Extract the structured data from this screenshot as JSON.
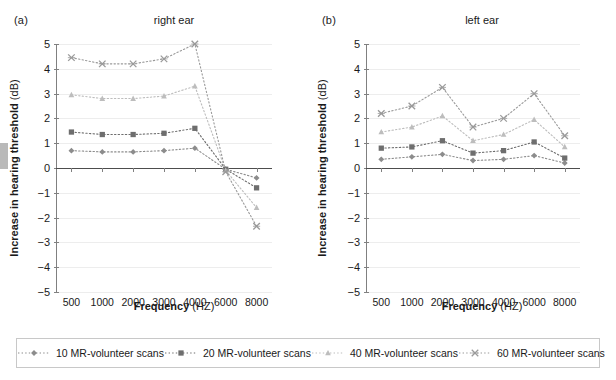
{
  "figure": {
    "width": 616,
    "height": 380,
    "panels": [
      {
        "tag": "(a)",
        "title": "right ear"
      },
      {
        "tag": "(b)",
        "title": "left ear"
      }
    ],
    "axis": {
      "xlabel_bold": "Frequency",
      "xlabel_rest": " (HZ)",
      "ylabel_bold": "Increase in hearing threshold",
      "ylabel_rest": " (dB)",
      "yticks": [
        "5",
        "4",
        "3",
        "2",
        "1",
        "0",
        "-1",
        "-2",
        "-3",
        "-4",
        "-5"
      ],
      "xticks": [
        "500",
        "1000",
        "2000",
        "3000",
        "4000",
        "6000",
        "8000"
      ]
    }
  },
  "legend": {
    "items": [
      {
        "label": "10 MR-volunteer scans",
        "marker": "diamond-marker",
        "color": "#8c8c8c"
      },
      {
        "label": "20 MR-volunteer scans",
        "marker": "square-marker",
        "color": "#6e6e6e"
      },
      {
        "label": "40 MR-volunteer scans",
        "marker": "triangle-marker",
        "color": "#bdbdbd"
      },
      {
        "label": "60 MR-volunteer scans",
        "marker": "x-marker",
        "color": "#9a9a9a"
      }
    ]
  },
  "chart_data": [
    {
      "type": "line",
      "title": "right ear",
      "panel": "(a)",
      "xlabel": "Frequency (HZ)",
      "ylabel": "Increase in hearing threshold (dB)",
      "categories": [
        500,
        1000,
        2000,
        3000,
        4000,
        6000,
        8000
      ],
      "ylim": [
        -5,
        5
      ],
      "grid": true,
      "legend_position": "bottom",
      "series": [
        {
          "name": "10 MR-volunteer scans",
          "marker": "diamond",
          "color": "#8c8c8c",
          "values": [
            0.7,
            0.65,
            0.65,
            0.7,
            0.8,
            -0.05,
            -0.4
          ]
        },
        {
          "name": "20 MR-volunteer scans",
          "marker": "square",
          "color": "#6e6e6e",
          "values": [
            1.45,
            1.35,
            1.35,
            1.4,
            1.6,
            -0.05,
            -0.8
          ]
        },
        {
          "name": "40 MR-volunteer scans",
          "marker": "triangle",
          "color": "#bdbdbd",
          "values": [
            2.95,
            2.8,
            2.8,
            2.9,
            3.3,
            -0.1,
            -1.6
          ]
        },
        {
          "name": "60 MR-volunteer scans",
          "marker": "x",
          "color": "#9a9a9a",
          "values": [
            4.45,
            4.2,
            4.2,
            4.4,
            5.0,
            -0.15,
            -2.35
          ]
        }
      ]
    },
    {
      "type": "line",
      "title": "left ear",
      "panel": "(b)",
      "xlabel": "Frequency (HZ)",
      "ylabel": "Increase in hearing threshold (dB)",
      "categories": [
        500,
        1000,
        2000,
        3000,
        4000,
        6000,
        8000
      ],
      "ylim": [
        -5,
        5
      ],
      "grid": true,
      "legend_position": "bottom",
      "series": [
        {
          "name": "10 MR-volunteer scans",
          "marker": "diamond",
          "color": "#8c8c8c",
          "values": [
            0.35,
            0.45,
            0.55,
            0.3,
            0.35,
            0.5,
            0.2
          ]
        },
        {
          "name": "20 MR-volunteer scans",
          "marker": "square",
          "color": "#6e6e6e",
          "values": [
            0.8,
            0.85,
            1.1,
            0.6,
            0.7,
            1.05,
            0.4
          ]
        },
        {
          "name": "40 MR-volunteer scans",
          "marker": "triangle",
          "color": "#bdbdbd",
          "values": [
            1.45,
            1.65,
            2.1,
            1.1,
            1.35,
            1.95,
            0.85
          ]
        },
        {
          "name": "60 MR-volunteer scans",
          "marker": "x",
          "color": "#9a9a9a",
          "values": [
            2.2,
            2.5,
            3.25,
            1.65,
            2.0,
            3.0,
            1.3
          ]
        }
      ]
    }
  ]
}
